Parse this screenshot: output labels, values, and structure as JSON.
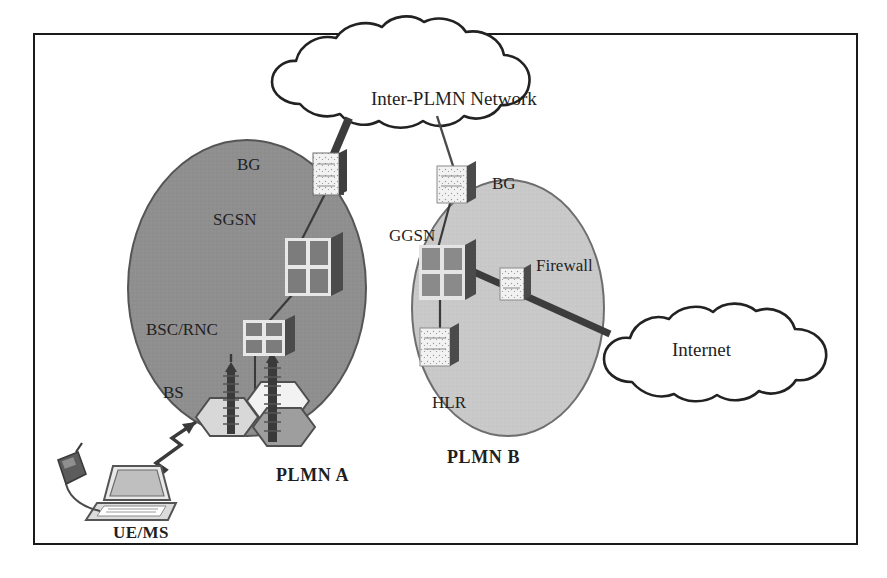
{
  "diagram": {
    "border_color": "#1a1a1a",
    "background": "#ffffff"
  },
  "clouds": [
    {
      "id": "inter-plmn",
      "label": "Inter-PLMN Network",
      "fill": "#ffffff",
      "stroke": "#1a1a1a"
    },
    {
      "id": "internet",
      "label": "Internet",
      "fill": "#ffffff",
      "stroke": "#1a1a1a"
    }
  ],
  "domains": [
    {
      "id": "plmn-a",
      "label": "PLMN A",
      "fill": "#8f8f8f",
      "stroke": "#4a4a4a"
    },
    {
      "id": "plmn-b",
      "label": "PLMN B",
      "fill": "#c9c9c9",
      "stroke": "#6a6a6a"
    }
  ],
  "nodes": [
    {
      "id": "bg-a",
      "label": "BG",
      "domain": "plmn-a",
      "icon": "router-icon"
    },
    {
      "id": "sgsn",
      "label": "SGSN",
      "domain": "plmn-a",
      "icon": "server-icon"
    },
    {
      "id": "bsc-rnc",
      "label": "BSC/RNC",
      "domain": "plmn-a",
      "icon": "server-icon"
    },
    {
      "id": "bs",
      "label": "BS",
      "domain": "plmn-a",
      "icon": "antenna-icon"
    },
    {
      "id": "bg-b",
      "label": "BG",
      "domain": "plmn-b",
      "icon": "router-icon"
    },
    {
      "id": "ggsn",
      "label": "GGSN",
      "domain": "plmn-b",
      "icon": "server-icon"
    },
    {
      "id": "firewall",
      "label": "Firewall",
      "domain": "plmn-b",
      "icon": "router-icon"
    },
    {
      "id": "hlr",
      "label": "HLR",
      "domain": "plmn-b",
      "icon": "router-icon"
    }
  ],
  "terminal": {
    "id": "ue-ms",
    "label": "UE/MS",
    "devices": [
      "laptop-icon",
      "mobile-phone-icon"
    ],
    "radio_link": "zigzag-arrow-icon"
  },
  "links": [
    {
      "from": "bg-a",
      "to": "inter-plmn",
      "style": "thick"
    },
    {
      "from": "bg-b",
      "to": "inter-plmn",
      "style": "thin"
    },
    {
      "from": "bg-a",
      "to": "sgsn",
      "style": "thin"
    },
    {
      "from": "sgsn",
      "to": "bsc-rnc",
      "style": "thin"
    },
    {
      "from": "bsc-rnc",
      "to": "bs",
      "style": "thin"
    },
    {
      "from": "bg-b",
      "to": "ggsn",
      "style": "thin"
    },
    {
      "from": "ggsn",
      "to": "hlr",
      "style": "thin"
    },
    {
      "from": "ggsn",
      "to": "firewall",
      "style": "thick"
    },
    {
      "from": "firewall",
      "to": "internet",
      "style": "thick"
    },
    {
      "from": "ue-ms",
      "to": "bs",
      "style": "radio"
    }
  ],
  "labels": {
    "cloud_inter_plmn": "Inter-PLMN Network",
    "cloud_internet": "Internet",
    "bg_a": "BG",
    "sgsn": "SGSN",
    "bsc_rnc": "BSC/RNC",
    "bs": "BS",
    "bg_b": "BG",
    "ggsn": "GGSN",
    "firewall": "Firewall",
    "hlr": "HLR",
    "plmn_a": "PLMN A",
    "plmn_b": "PLMN B",
    "ue_ms": "UE/MS"
  }
}
